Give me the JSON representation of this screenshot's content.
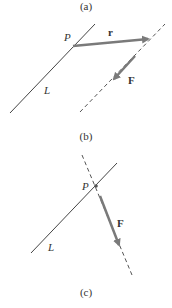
{
  "panels": {
    "a": {
      "caption": "(a)",
      "point_label": "P",
      "line_label": "L",
      "vector_r_label": "r",
      "vector_f_label": "F"
    },
    "b": {
      "caption": "(b)",
      "point_label": "P",
      "line_label": "L",
      "vector_f_label": "F"
    },
    "c": {
      "caption": "(c)"
    }
  },
  "colors": {
    "line": "#444444",
    "vector": "#7a7a7a",
    "dashed": "#555555",
    "text": "#333333"
  }
}
